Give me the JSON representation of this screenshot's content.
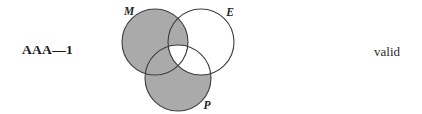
{
  "figure": {
    "form_label": "AAA—1",
    "validity_label": "valid"
  },
  "venn": {
    "labels": {
      "major": "M",
      "minor": "E",
      "middle": "P"
    },
    "colors": {
      "shaded": "#aaaaaa",
      "unshaded": "#ffffff",
      "stroke": "#3d3d3d",
      "background": "#ffffff",
      "text": "#1f1f1f"
    },
    "circles": [
      {
        "id": "M",
        "cx": 43,
        "cy": 42,
        "r": 33
      },
      {
        "id": "E",
        "cx": 89,
        "cy": 42,
        "r": 33
      },
      {
        "id": "P",
        "cx": 66,
        "cy": 78,
        "r": 33
      }
    ],
    "regions": [
      {
        "id": "M-only",
        "shaded": true
      },
      {
        "id": "M-and-E",
        "shaded": true
      },
      {
        "id": "M-and-P",
        "shaded": true
      },
      {
        "id": "M-E-P",
        "shaded": false
      },
      {
        "id": "E-only",
        "shaded": false
      },
      {
        "id": "E-and-P",
        "shaded": false
      },
      {
        "id": "P-only",
        "shaded": true
      }
    ]
  }
}
